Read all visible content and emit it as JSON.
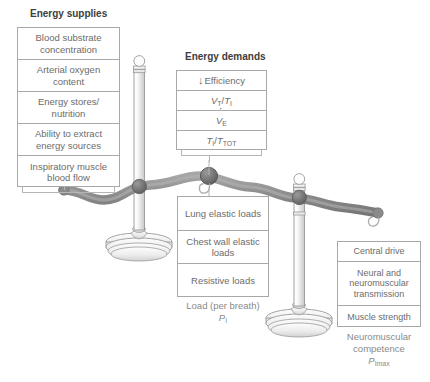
{
  "figure": {
    "type": "balance-scale-diagram"
  },
  "supplies": {
    "title": "Energy supplies",
    "items": [
      "Blood substrate concentration",
      "Arterial oxygen content",
      "Energy stores/ nutrition",
      "Ability to extract energy sources",
      "Inspiratory muscle blood flow"
    ]
  },
  "demands": {
    "title": "Energy demands",
    "items": [
      {
        "arrow": "↓",
        "label": "Efficiency"
      },
      {
        "numerator": "V",
        "num_sub": "T",
        "denominator": "T",
        "den_sub": "I",
        "label": "VT/TI"
      },
      {
        "label": "V̇E",
        "base": "V",
        "sub": "E",
        "dot": true
      },
      {
        "numerator": "T",
        "num_sub": "I",
        "denominator": "T",
        "den_sub": "TOT",
        "label": "TI/TTOT"
      }
    ]
  },
  "load": {
    "items": [
      "Lung elastic loads",
      "Chest wall elastic loads",
      "Resistive loads"
    ],
    "caption_line1": "Load (per breath)",
    "caption_symbol": "P",
    "caption_symbol_sub": "I"
  },
  "neuromuscular": {
    "items": [
      "Central drive",
      "Neural and neuromuscular transmission",
      "Muscle strength"
    ],
    "caption_line1": "Neuromuscular",
    "caption_line2": "competence",
    "caption_symbol": "P",
    "caption_symbol_sub": "Imax"
  },
  "colors": {
    "beam": "#8e8e8e",
    "joint": "#6a6a6a",
    "pole_outline": "#9a9a9a",
    "box_border": "#a8a8a8",
    "text": "#6c6c6c",
    "title_text": "#3d3d3d",
    "background": "#ffffff"
  }
}
